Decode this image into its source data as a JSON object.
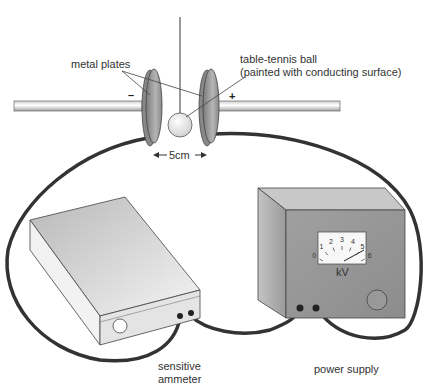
{
  "labels": {
    "metal_plates": "metal plates",
    "ball_line1": "table-tennis ball",
    "ball_line2": "(painted with conducting surface)",
    "minus": "–",
    "plus": "+",
    "distance": "5cm",
    "ammeter_line1": "sensitive",
    "ammeter_line2": "ammeter",
    "power_supply": "power supply",
    "meter_unit": "kV"
  },
  "meter": {
    "ticks": [
      "0",
      "1",
      "2",
      "3",
      "4",
      "5",
      "6"
    ]
  },
  "colors": {
    "wire": "#333333",
    "plate": "#9a9a9a",
    "box": "#a8a8a8",
    "ammeter": "#e6e6e6"
  }
}
